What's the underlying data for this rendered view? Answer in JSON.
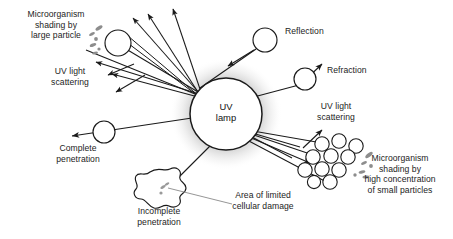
{
  "figure": {
    "type": "scientific-diagram",
    "background_color": "#ffffff",
    "line_color": "#1a1a1a",
    "particle_fill": "#ffffff",
    "microbe_color": "#8f8f8f",
    "glow_color": "#c9c9c9"
  },
  "lamp": {
    "label": "UV\nlamp",
    "cx": 226,
    "cy": 114,
    "r": 36
  },
  "labels": {
    "microorganism_shading_large": "Microorganism\nshading by\nlarge particle",
    "uv_light_scattering_left": "UV light\nscattering",
    "complete_penetration": "Complete\npenetration",
    "incomplete_penetration": "Incomplete\npenetration",
    "area_limited_damage": "Area of limited\ncellular damage",
    "reflection": "Reflection",
    "refraction": "Refraction",
    "uv_light_scattering_right": "UV light\nscattering",
    "microorganism_shading_small": "Microorganism\nshading by\nhigh concentration\nof small particles"
  },
  "elements": {
    "large_particle": {
      "cx": 118,
      "cy": 43,
      "r": 13
    },
    "reflection_particle": {
      "cx": 265,
      "cy": 40,
      "r": 12
    },
    "refraction_particle": {
      "cx": 305,
      "cy": 79,
      "r": 11
    },
    "complete_penetration_particle": {
      "cx": 104,
      "cy": 132,
      "r": 11
    },
    "cell_blob": {
      "cx": 166,
      "cy": 192
    },
    "small_particle_cluster_count": 11
  }
}
